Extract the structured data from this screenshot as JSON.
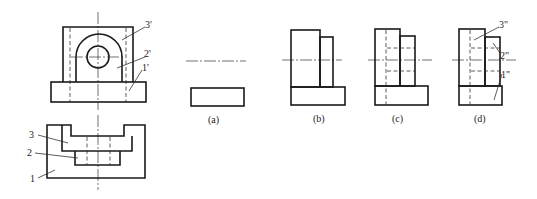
{
  "figure": {
    "front_view": {
      "labels": [
        "3'",
        "2'",
        "1'"
      ]
    },
    "top_view": {
      "labels": [
        "3",
        "2",
        "1"
      ]
    },
    "side_views": [
      {
        "caption": "(a)"
      },
      {
        "caption": "(b)"
      },
      {
        "caption": "(c)"
      },
      {
        "caption": "(d)",
        "labels": [
          "3\"",
          "2\"",
          "1\""
        ]
      }
    ]
  },
  "colors": {
    "line": "#1a1a1a",
    "background": "#ffffff"
  }
}
